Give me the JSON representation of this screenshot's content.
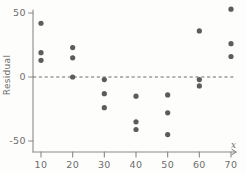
{
  "chart_data": {
    "type": "scatter",
    "title": "",
    "xlabel": "x",
    "ylabel": "Residual",
    "xlim": [
      3,
      74
    ],
    "ylim": [
      -62,
      57
    ],
    "xticks": [
      10,
      20,
      30,
      40,
      50,
      60,
      70
    ],
    "yticks": [
      50,
      0,
      -50
    ],
    "xtick_labels": [
      "10",
      "20",
      "30",
      "40",
      "50",
      "60",
      "70"
    ],
    "ytick_labels": [
      "50",
      "0",
      "-50"
    ],
    "grid": false,
    "legend": null,
    "reference_line": {
      "orientation": "horizontal",
      "value": 0,
      "style": "dashed"
    },
    "point_color": "#5c5c5e",
    "axis_color": "#8a8a88",
    "series": [
      {
        "name": "residuals",
        "points": [
          {
            "x": 10,
            "y": 42
          },
          {
            "x": 10,
            "y": 19
          },
          {
            "x": 10,
            "y": 13
          },
          {
            "x": 20,
            "y": 23
          },
          {
            "x": 20,
            "y": 15
          },
          {
            "x": 20,
            "y": 0
          },
          {
            "x": 30,
            "y": -2
          },
          {
            "x": 30,
            "y": -13
          },
          {
            "x": 30,
            "y": -24
          },
          {
            "x": 40,
            "y": -15
          },
          {
            "x": 40,
            "y": -35
          },
          {
            "x": 40,
            "y": -41
          },
          {
            "x": 50,
            "y": -14
          },
          {
            "x": 50,
            "y": -28
          },
          {
            "x": 50,
            "y": -45
          },
          {
            "x": 60,
            "y": 36
          },
          {
            "x": 60,
            "y": -2
          },
          {
            "x": 60,
            "y": -7
          },
          {
            "x": 70,
            "y": 53
          },
          {
            "x": 70,
            "y": 26
          },
          {
            "x": 70,
            "y": 16
          }
        ]
      }
    ]
  }
}
